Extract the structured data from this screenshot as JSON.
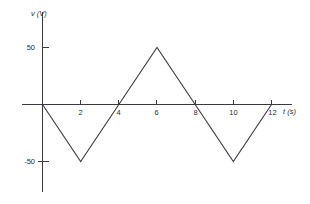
{
  "figure": {
    "background_color": "#ffffff",
    "line_color": "#3a3a42",
    "text_color": "#2b2b30",
    "y_axis_title": "v (V)",
    "x_axis_title": "t (s)"
  },
  "chart_data": {
    "type": "line",
    "title": "",
    "subtitle": "",
    "xlabel": "t (s)",
    "ylabel": "v (V)",
    "xlim": [
      -1,
      13.5
    ],
    "ylim": [
      -75,
      75
    ],
    "grid": false,
    "legend": false,
    "xticks": [
      2,
      4,
      6,
      8,
      10,
      12
    ],
    "xtick_labels": [
      "2",
      "4",
      "6",
      "8",
      "10",
      "12"
    ],
    "yticks": [
      50,
      -50
    ],
    "ytick_labels": [
      "50",
      "-50"
    ],
    "series": [
      {
        "name": "v(t)",
        "x": [
          0,
          2,
          4,
          6,
          8,
          10,
          12
        ],
        "values": [
          0,
          -50,
          0,
          50,
          0,
          -50,
          0
        ]
      }
    ],
    "annotations": []
  }
}
